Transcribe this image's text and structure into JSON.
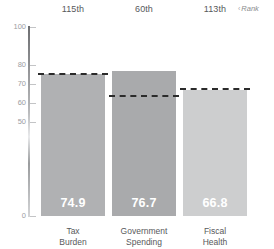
{
  "chart_data": {
    "type": "bar",
    "title": "",
    "subtitle": "",
    "xlabel": "",
    "ylabel": "",
    "ylim": [
      0,
      100
    ],
    "grid": false,
    "legend_position": "top-right",
    "categories": [
      "Tax Burden",
      "Government Spending",
      "Fiscal Health"
    ],
    "category_lines": [
      [
        "Tax",
        "Burden"
      ],
      [
        "Government",
        "Spending"
      ],
      [
        "Fiscal",
        "Health"
      ]
    ],
    "values": [
      74.9,
      76.7,
      66.8
    ],
    "value_labels": [
      "74.9",
      "76.7",
      "66.8"
    ],
    "ranks": [
      "115th",
      "60th",
      "113th"
    ],
    "rank_legend": "Rank",
    "rank_legend_mark": "‹",
    "reference_lines": {
      "name": "average",
      "values": [
        75.6,
        64.2,
        67.6
      ],
      "style": "dashed",
      "color": "#2b2b2b"
    },
    "series": [
      {
        "name": "Score",
        "values": [
          74.9,
          76.7,
          66.8
        ]
      }
    ],
    "yticks": [
      100,
      80,
      70,
      60,
      50,
      0
    ],
    "ytick_labels": [
      "100",
      "80",
      "70",
      "60",
      "50",
      "0"
    ],
    "bar_colors": [
      "#b0b1b3",
      "#a9aaac",
      "#cdcecf"
    ],
    "axis_color": "#9b9d9f",
    "value_label_color": "#ffffff",
    "text_color": "#58595b"
  }
}
